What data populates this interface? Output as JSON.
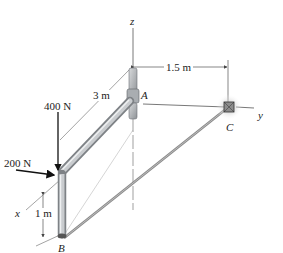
{
  "figure": {
    "type": "3D statics diagram",
    "axes": {
      "x": "x",
      "y": "y",
      "z": "z"
    },
    "points": {
      "A": "A",
      "B": "B",
      "C": "C"
    },
    "dimensions": {
      "AC_y": "1.5 m",
      "arm_x": "3 m",
      "drop_z": "1 m"
    },
    "forces": {
      "vertical": "400 N",
      "horizontal": "200 N"
    },
    "colors": {
      "pipe": "#b9bcbf",
      "pipe_dark": "#7e8286",
      "line": "#555555",
      "cable": "#8a8a8a",
      "arrow": "#111111"
    }
  }
}
